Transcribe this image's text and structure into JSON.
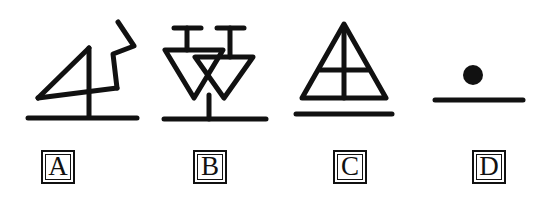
{
  "plate": {
    "title": "Hand-drawn geometric figure plate",
    "background_color": "#ffffff",
    "ink_color": "#111111",
    "figure_count": 4
  },
  "figures": [
    {
      "id": "A",
      "label": "A",
      "name": "triangle-with-zigzag-figure",
      "description": "Right triangle with vertical stem crossing a horizontal baseline, joined to an angular zigzag line rising to the upper right",
      "parts": [
        "triangle",
        "vertical-stem",
        "baseline",
        "zigzag-polyline"
      ],
      "label_box_x": 41,
      "label_box_y": 10
    },
    {
      "id": "B",
      "label": "B",
      "name": "double-triangle-with-stems-figure",
      "description": "Two downward-pointing triangles overlapping, each topped by a vertical stem with a horizontal T bar, converging into a single vertical stem resting on a baseline",
      "parts": [
        "left-triangle",
        "right-triangle",
        "left-t-stem",
        "right-t-stem",
        "center-stem",
        "baseline"
      ],
      "label_box_x": 193,
      "label_box_y": 10
    },
    {
      "id": "C",
      "label": "C",
      "name": "triangle-with-cross-figure",
      "description": "Upward-pointing triangle divided by a vertical line from apex to base and a horizontal crossbar, above a separate horizontal baseline",
      "parts": [
        "triangle",
        "vertical-divider",
        "horizontal-crossbar",
        "baseline"
      ],
      "label_box_x": 333,
      "label_box_y": 10
    },
    {
      "id": "D",
      "label": "D",
      "name": "dot-above-line-figure",
      "description": "A solid filled circle positioned above a horizontal baseline",
      "parts": [
        "filled-dot",
        "baseline"
      ],
      "label_box_x": 472,
      "label_box_y": 10
    }
  ]
}
